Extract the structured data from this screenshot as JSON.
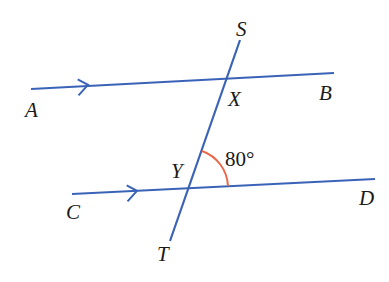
{
  "diagram": {
    "colors": {
      "line": "#3a63b8",
      "angle_arc": "#e8694a",
      "text": "#1a1a1a"
    },
    "lines": [
      {
        "name": "AB",
        "from": "A",
        "to": "B",
        "parallel_marker": "single-arrow"
      },
      {
        "name": "CD",
        "from": "C",
        "to": "D",
        "parallel_marker": "single-arrow"
      },
      {
        "name": "ST",
        "from": "S",
        "to": "T",
        "role": "transversal"
      }
    ],
    "points": {
      "A": "A",
      "B": "B",
      "C": "C",
      "D": "D",
      "S": "S",
      "T": "T",
      "X": "X",
      "Y": "Y"
    },
    "angle": {
      "vertex": "Y",
      "between": [
        "YX",
        "YD"
      ],
      "label": "80°"
    }
  }
}
